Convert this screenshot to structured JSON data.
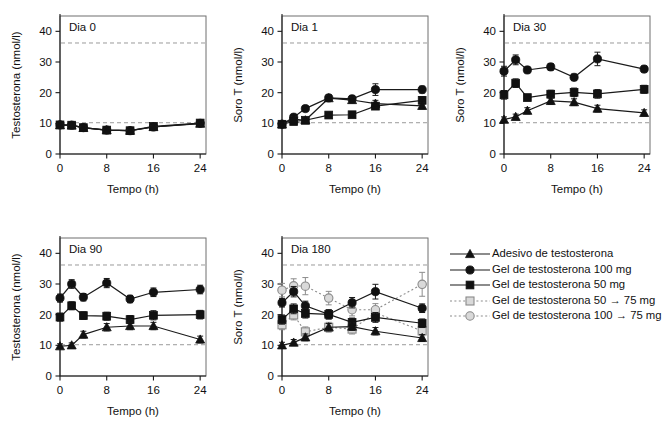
{
  "figure": {
    "panel_order": [
      "dia0",
      "dia1",
      "dia30",
      "dia90",
      "dia180"
    ],
    "x_axis_title": "Tempo (h)",
    "x_ticks": [
      "0",
      "8",
      "16",
      "24"
    ],
    "y_ticks": [
      "0",
      "10",
      "20",
      "30",
      "40"
    ],
    "y_title_testosterona": "Testosterona (nmol/l)",
    "y_title_soro": "Soro T (nmol/l)"
  },
  "legend": {
    "items": [
      {
        "label": "Adesivo de testosterona",
        "marker": "triangle-filled",
        "line": "solid",
        "color": "#111111"
      },
      {
        "label": "Gel de testosterona 100 mg",
        "marker": "circle-filled",
        "line": "solid",
        "color": "#111111"
      },
      {
        "label": "Gel de testosterona 50 mg",
        "marker": "square-filled",
        "line": "solid",
        "color": "#111111"
      },
      {
        "label": "Gel de testosterona 50 → 75 mg",
        "marker": "square-open",
        "line": "dotted",
        "color": "#8c8c8c"
      },
      {
        "label": "Gel de testosterona 100 → 75 mg",
        "marker": "circle-open",
        "line": "dotted",
        "color": "#8c8c8c"
      }
    ]
  },
  "chart_data": [
    {
      "type": "line",
      "id": "dia0",
      "title": "Dia 0",
      "xlabel": "Tempo (h)",
      "ylabel": "Testosterona (nmol/l)",
      "xlim": [
        0,
        25
      ],
      "ylim": [
        0,
        45
      ],
      "xticks": [
        0,
        8,
        16,
        24
      ],
      "yticks": [
        0,
        10,
        20,
        30,
        40
      ],
      "grid": false,
      "reference_lines": [
        10.2,
        36.2
      ],
      "x": [
        0,
        2,
        4,
        8,
        12,
        16,
        24
      ],
      "series": [
        {
          "name": "Gel de testosterona 100 mg",
          "marker": "circle-filled",
          "line": "solid",
          "values": [
            9.5,
            9.4,
            8.6,
            7.8,
            7.6,
            8.8,
            10.0
          ],
          "errors": [
            0.5,
            0.5,
            0.5,
            0.5,
            0.5,
            0.6,
            0.6
          ]
        },
        {
          "name": "Gel de testosterona 50 mg",
          "marker": "square-filled",
          "line": "solid",
          "values": [
            9.5,
            9.4,
            8.6,
            7.8,
            7.6,
            9.0,
            10.1
          ],
          "errors": [
            0.5,
            0.5,
            0.5,
            0.5,
            0.5,
            0.6,
            0.6
          ]
        },
        {
          "name": "Adesivo de testosterona",
          "marker": "triangle-filled",
          "line": "solid",
          "values": [
            9.4,
            9.3,
            8.5,
            7.8,
            7.6,
            8.8,
            9.9
          ],
          "errors": [
            0.4,
            0.4,
            0.4,
            0.4,
            0.4,
            0.5,
            0.5
          ]
        }
      ]
    },
    {
      "type": "line",
      "id": "dia1",
      "title": "Dia 1",
      "xlabel": "Tempo (h)",
      "ylabel": "Soro T (nmol/l)",
      "xlim": [
        0,
        25
      ],
      "ylim": [
        0,
        45
      ],
      "xticks": [
        0,
        8,
        16,
        24
      ],
      "yticks": [
        0,
        10,
        20,
        30,
        40
      ],
      "grid": false,
      "reference_lines": [
        10.2,
        36.2
      ],
      "x": [
        0,
        2,
        4,
        8,
        12,
        16,
        24
      ],
      "series": [
        {
          "name": "Gel de testosterona 100 mg",
          "marker": "circle-filled",
          "line": "solid",
          "values": [
            9.7,
            12.0,
            14.8,
            18.3,
            18.0,
            21.0,
            21.0
          ],
          "errors": [
            0.5,
            0.7,
            0.9,
            1.0,
            0.9,
            1.9,
            1.1
          ]
        },
        {
          "name": "Gel de testosterona 50 mg",
          "marker": "square-filled",
          "line": "solid",
          "values": [
            9.7,
            10.6,
            11.0,
            12.7,
            12.8,
            15.6,
            17.5
          ],
          "errors": [
            0.5,
            0.7,
            0.8,
            0.9,
            0.9,
            1.0,
            1.2
          ]
        },
        {
          "name": "Adesivo de testosterona",
          "marker": "triangle-filled",
          "line": "solid",
          "values": [
            9.7,
            11.4,
            11.0,
            18.2,
            17.6,
            16.4,
            15.7
          ],
          "errors": [
            0.5,
            0.8,
            0.8,
            0.9,
            0.9,
            1.1,
            1.0
          ]
        }
      ]
    },
    {
      "type": "line",
      "id": "dia30",
      "title": "Dia 30",
      "xlabel": "Tempo (h)",
      "ylabel": "Soro T (nmol/l)",
      "xlim": [
        0,
        25
      ],
      "ylim": [
        0,
        45
      ],
      "xticks": [
        0,
        8,
        16,
        24
      ],
      "yticks": [
        0,
        10,
        20,
        30,
        40
      ],
      "grid": false,
      "reference_lines": [
        10.2,
        36.2
      ],
      "x": [
        0,
        2,
        4,
        8,
        12,
        16,
        24
      ],
      "series": [
        {
          "name": "Gel de testosterona 100 mg",
          "marker": "circle-filled",
          "line": "solid",
          "values": [
            27.0,
            30.7,
            27.4,
            28.4,
            25.0,
            31.0,
            27.7
          ],
          "errors": [
            1.6,
            1.6,
            1.0,
            1.1,
            1.0,
            2.2,
            1.0
          ]
        },
        {
          "name": "Gel de testosterona 50 mg",
          "marker": "square-filled",
          "line": "solid",
          "values": [
            19.3,
            23.1,
            18.4,
            19.5,
            20.1,
            19.6,
            21.1
          ],
          "errors": [
            1.4,
            1.4,
            1.0,
            1.3,
            1.4,
            1.4,
            1.3
          ]
        },
        {
          "name": "Adesivo de testosterona",
          "marker": "triangle-filled",
          "line": "solid",
          "values": [
            11.2,
            12.1,
            14.1,
            17.3,
            16.9,
            14.8,
            13.4
          ],
          "errors": [
            0.9,
            0.9,
            1.0,
            1.1,
            1.1,
            1.1,
            1.0
          ]
        }
      ]
    },
    {
      "type": "line",
      "id": "dia90",
      "title": "Dia 90",
      "xlabel": "Tempo (h)",
      "ylabel": "Testosterona (nmol/l)",
      "xlim": [
        0,
        25
      ],
      "ylim": [
        0,
        45
      ],
      "xticks": [
        0,
        8,
        16,
        24
      ],
      "yticks": [
        0,
        10,
        20,
        30,
        40
      ],
      "grid": false,
      "reference_lines": [
        10.2,
        36.2
      ],
      "x": [
        0,
        2,
        4,
        8,
        12,
        16,
        24
      ],
      "series": [
        {
          "name": "Gel de testosterona 100 mg",
          "marker": "circle-filled",
          "line": "solid",
          "values": [
            25.4,
            30.0,
            25.7,
            30.3,
            25.1,
            27.3,
            28.2
          ],
          "errors": [
            1.3,
            1.4,
            1.2,
            1.5,
            1.2,
            1.4,
            1.4
          ]
        },
        {
          "name": "Gel de testosterona 50 mg",
          "marker": "square-filled",
          "line": "solid",
          "values": [
            19.2,
            22.9,
            19.7,
            19.5,
            18.4,
            19.8,
            20.0
          ],
          "errors": [
            1.3,
            1.3,
            1.2,
            1.3,
            1.3,
            1.5,
            1.4
          ]
        },
        {
          "name": "Adesivo de testosterona",
          "marker": "triangle-filled",
          "line": "solid",
          "values": [
            9.7,
            10.0,
            13.5,
            15.9,
            16.3,
            16.3,
            11.9
          ],
          "errors": [
            0.8,
            0.8,
            1.1,
            1.2,
            1.2,
            1.2,
            1.1
          ]
        }
      ]
    },
    {
      "type": "line",
      "id": "dia180",
      "title": "Dia 180",
      "xlabel": "Tempo (h)",
      "ylabel": "Soro T (nmol/l)",
      "xlim": [
        0,
        25
      ],
      "ylim": [
        0,
        45
      ],
      "xticks": [
        0,
        8,
        16,
        24
      ],
      "yticks": [
        0,
        10,
        20,
        30,
        40
      ],
      "grid": false,
      "reference_lines": [
        10.2,
        36.2
      ],
      "x": [
        0,
        2,
        4,
        8,
        12,
        16,
        24
      ],
      "series": [
        {
          "name": "Gel de testosterona 100 mg",
          "marker": "circle-filled",
          "line": "solid",
          "values": [
            23.9,
            27.5,
            22.9,
            20.1,
            23.9,
            27.5,
            22.1
          ],
          "errors": [
            1.4,
            1.7,
            1.5,
            1.5,
            1.7,
            2.4,
            1.4
          ]
        },
        {
          "name": "Gel de testosterona 50 mg",
          "marker": "square-filled",
          "line": "solid",
          "values": [
            18.4,
            21.9,
            20.4,
            20.1,
            17.5,
            19.1,
            17.2
          ],
          "errors": [
            1.5,
            1.6,
            1.5,
            1.5,
            1.4,
            1.6,
            1.4
          ]
        },
        {
          "name": "Adesivo de testosterona",
          "marker": "triangle-filled",
          "line": "solid",
          "values": [
            10.0,
            10.9,
            12.6,
            15.9,
            16.1,
            14.6,
            12.4
          ],
          "errors": [
            1.0,
            1.0,
            1.1,
            1.2,
            1.2,
            1.2,
            1.1
          ]
        },
        {
          "name": "Gel de testosterona 50 → 75 mg",
          "marker": "square-open",
          "line": "dotted",
          "values": [
            16.7,
            19.9,
            14.4,
            15.9,
            15.3,
            20.6,
            14.7
          ],
          "errors": [
            1.6,
            1.6,
            1.6,
            1.6,
            1.6,
            1.9,
            1.6
          ]
        },
        {
          "name": "Gel de testosterona 100 → 75 mg",
          "marker": "circle-open",
          "line": "dotted",
          "values": [
            28.0,
            29.4,
            29.3,
            25.4,
            21.6,
            21.6,
            29.9
          ],
          "errors": [
            2.2,
            2.3,
            2.8,
            2.2,
            2.0,
            2.0,
            3.9
          ]
        }
      ]
    }
  ]
}
